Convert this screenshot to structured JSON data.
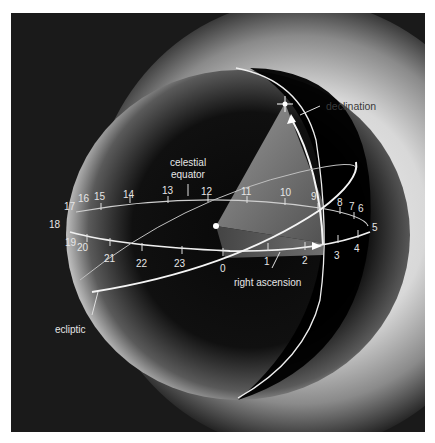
{
  "diagram": {
    "labels": {
      "declination": "declination",
      "celestial_equator_line1": "celestial",
      "celestial_equator_line2": "equator",
      "right_ascension": "right ascension",
      "ecliptic": "ecliptic"
    },
    "hour_marks": {
      "h0": "0",
      "h1": "1",
      "h2": "2",
      "h3": "3",
      "h4": "4",
      "h5": "5",
      "h6": "6",
      "h7": "7",
      "h8": "8",
      "h9": "9",
      "h10": "10",
      "h11": "11",
      "h12": "12",
      "h13": "13",
      "h14": "14",
      "h15": "15",
      "h16": "16",
      "h17": "17",
      "h18": "18",
      "h19": "19",
      "h20": "20",
      "h21": "21",
      "h22": "22",
      "h23": "23"
    },
    "colors": {
      "background": "#1a1a1a",
      "sphere_dark": "#0a0a0a",
      "glow": "#e8e8e8",
      "lines": "#f2f2f2",
      "wedge": "#8a8a8a"
    }
  }
}
